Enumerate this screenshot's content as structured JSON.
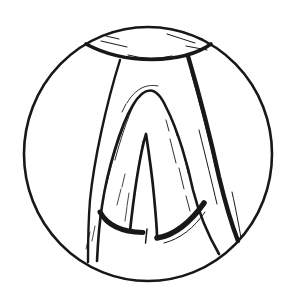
{
  "figure": {
    "ink": "#181818",
    "background": "#ffffff",
    "parts": [
      "field-of-view-circle",
      "epiglottis-edge",
      "left-aryepiglottic-fold",
      "right-aryepiglottic-fold",
      "vestibular-fold-arch",
      "glottic-slit",
      "vocal-fold-lower-edges",
      "sketch-hatching"
    ]
  }
}
